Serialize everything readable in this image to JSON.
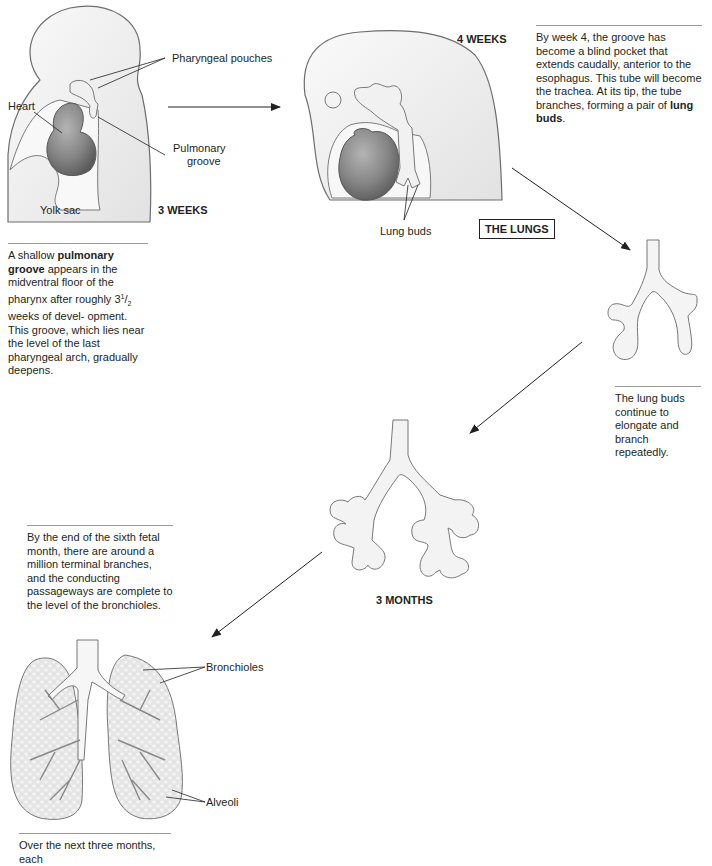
{
  "title": "THE LUNGS",
  "stages": {
    "week3": {
      "stage_label": "3 WEEKS",
      "labels": {
        "pharyngeal_pouches": "Pharyngeal pouches",
        "heart": "Heart",
        "pulmonary_groove_1": "Pulmonary",
        "pulmonary_groove_2": "groove",
        "yolk_sac": "Yolk sac"
      },
      "caption": {
        "bold_term": "pulmonary groove",
        "pre": "A shallow ",
        "line_a": "appears in the midventral floor of the pharynx after roughly 3",
        "fraction_num": "1",
        "fraction_den": "2",
        "line_b": " weeks of devel- opment. This groove, which lies near the level of the last pharyngeal arch, gradually deepens."
      }
    },
    "week4": {
      "stage_label": "4 WEEKS",
      "labels": {
        "lung_buds": "Lung buds"
      },
      "caption": {
        "text": "By week 4, the groove has become a blind pocket that extends caudally, anterior to the esophagus. This tube will become the trachea. At its tip, the tube branches, forming a pair of ",
        "bold_term": "lung buds",
        "post": "."
      }
    },
    "branching": {
      "caption": {
        "text": "The lung buds continue to elongate and branch repeatedly."
      }
    },
    "month3": {
      "stage_label": "3 MONTHS"
    },
    "month6": {
      "caption": {
        "text": "By the end of the sixth fetal month, there are around a million terminal branches, and the conducting passageways are complete to the level of the bronchioles."
      },
      "labels": {
        "bronchioles": "Bronchioles",
        "alveoli": "Alveoli"
      }
    },
    "final": {
      "caption": {
        "text": "Over the next three months, each"
      }
    }
  },
  "colors": {
    "tissue_fill": "#efefef",
    "tissue_stroke": "#6d6d6d",
    "heart_fill": "#8a8a8a",
    "heart_dark": "#5e5e5e",
    "lung_fill": "#e4e4e4",
    "line": "#231f20"
  }
}
